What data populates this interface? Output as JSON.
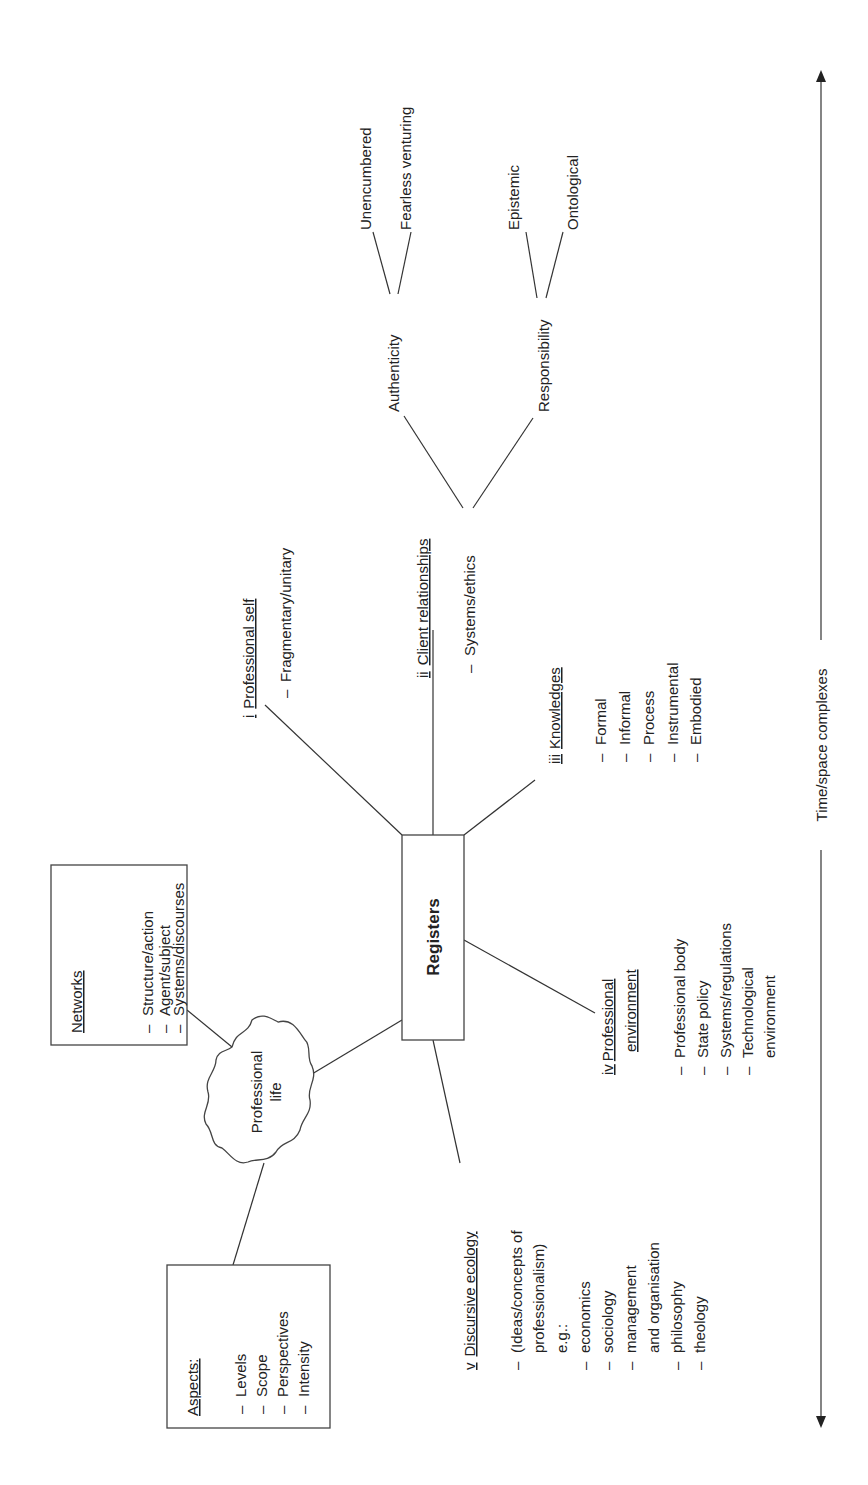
{
  "figure": {
    "orientation": "rotated-90-ccw",
    "center_node": {
      "label": "Registers"
    },
    "cloud_node": {
      "label_line1": "Professional",
      "label_line2": "life"
    },
    "networks_box": {
      "title": "Networks",
      "items": [
        "Structure/action",
        "Agent/subject",
        "Systems/discourses"
      ]
    },
    "aspects_box": {
      "title": "Aspects:",
      "items": [
        "Levels",
        "Scope",
        "Perspectives",
        "Intensity"
      ]
    },
    "registers": [
      {
        "numeral": "i",
        "title": "Professional self",
        "items": [
          "Fragmentary/unitary"
        ]
      },
      {
        "numeral": "ii",
        "title": "Client relationships",
        "items": [
          "Systems/ethics"
        ],
        "subtree": {
          "branches": [
            {
              "label": "Authenticity",
              "children": [
                "Unencumbered",
                "Fearless venturing"
              ]
            },
            {
              "label": "Responsibility",
              "children": [
                "Epistemic",
                "Ontological"
              ]
            }
          ]
        }
      },
      {
        "numeral": "iii",
        "title": "Knowledges",
        "items": [
          "Formal",
          "Informal",
          "Process",
          "Instrumental",
          "Embodied"
        ]
      },
      {
        "numeral": "iv",
        "title_line1": "Professional",
        "title_line2": "environment",
        "items": [
          "Professional body",
          "State policy",
          "Systems/regulations",
          "Technological",
          "environment"
        ]
      },
      {
        "numeral": "v",
        "title": "Discursive ecology",
        "items_line": [
          "(Ideas/concepts of",
          "professionalism)",
          "e.g.:"
        ],
        "items": [
          "economics",
          "sociology",
          "management",
          "and organisation",
          "philosophy",
          "theology"
        ]
      }
    ],
    "axis": {
      "label": "Time/space complexes",
      "direction": "bidirectional"
    },
    "dash": "–"
  }
}
